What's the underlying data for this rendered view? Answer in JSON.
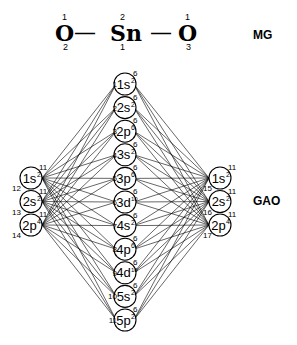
{
  "molecule": {
    "atoms": [
      {
        "symbol": "O",
        "top_index": "1",
        "bottom_index": "2"
      },
      {
        "symbol": "Sn",
        "top_index": "2",
        "bottom_index": "1"
      },
      {
        "symbol": "O",
        "top_index": "1",
        "bottom_index": "3"
      }
    ],
    "bond": "—",
    "label": "MG"
  },
  "gao_label": "GAO",
  "center_orbitals": [
    {
      "orb": "1s",
      "occ": "2",
      "group": "6",
      "index": "1"
    },
    {
      "orb": "2s",
      "occ": "2",
      "group": "6",
      "index": "2"
    },
    {
      "orb": "2p",
      "occ": "6",
      "group": "6",
      "index": "3"
    },
    {
      "orb": "3s",
      "occ": "2",
      "group": "6",
      "index": "4"
    },
    {
      "orb": "3p",
      "occ": "6",
      "group": "6",
      "index": "5"
    },
    {
      "orb": "3d",
      "occ": "10",
      "group": "6",
      "index": "6"
    },
    {
      "orb": "4s",
      "occ": "2",
      "group": "6",
      "index": "7"
    },
    {
      "orb": "4p",
      "occ": "6",
      "group": "6",
      "index": "8"
    },
    {
      "orb": "4d",
      "occ": "10",
      "group": "6",
      "index": "9"
    },
    {
      "orb": "5s",
      "occ": "2",
      "group": "6",
      "index": "10"
    },
    {
      "orb": "5p",
      "occ": "2",
      "group": "6",
      "index": "11"
    }
  ],
  "left_orbitals": [
    {
      "orb": "1s",
      "occ": "2",
      "group": "11",
      "index": "12"
    },
    {
      "orb": "2s",
      "occ": "2",
      "group": "11",
      "index": "13"
    },
    {
      "orb": "2p",
      "occ": "4",
      "group": "11",
      "index": "14"
    }
  ],
  "right_orbitals": [
    {
      "orb": "1s",
      "occ": "2",
      "group": "11",
      "index": "15"
    },
    {
      "orb": "2s",
      "occ": "2",
      "group": "11",
      "index": "16"
    },
    {
      "orb": "2p",
      "occ": "4",
      "group": "11",
      "index": "17"
    }
  ]
}
